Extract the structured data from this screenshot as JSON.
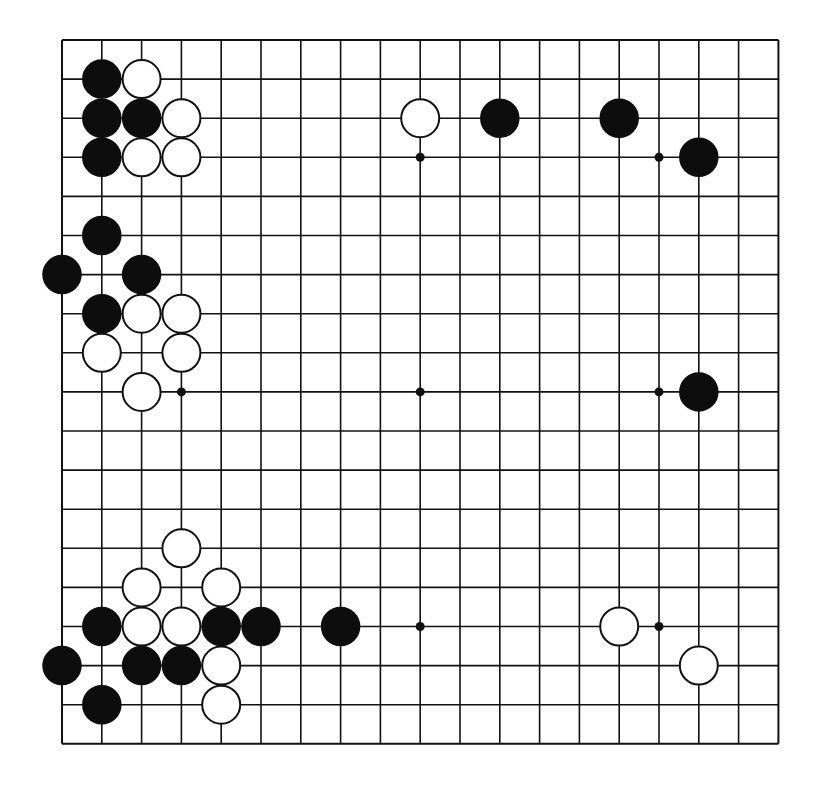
{
  "board": {
    "size": 19,
    "origin_x": 62,
    "origin_y": 40,
    "spacing_x": 39.8,
    "spacing_y": 39.1,
    "stone_radius": 19,
    "star_radius": 4.5,
    "colors": {
      "line": "#111111",
      "black_stone": "#0d0d0d",
      "white_stone": "#ffffff",
      "background": "#ffffff"
    },
    "star_points": [
      {
        "col": 3,
        "row": 3
      },
      {
        "col": 9,
        "row": 3
      },
      {
        "col": 15,
        "row": 3
      },
      {
        "col": 3,
        "row": 9
      },
      {
        "col": 9,
        "row": 9
      },
      {
        "col": 15,
        "row": 9
      },
      {
        "col": 3,
        "row": 15
      },
      {
        "col": 9,
        "row": 15
      },
      {
        "col": 15,
        "row": 15
      }
    ],
    "stones": [
      {
        "color": "black",
        "col": 1,
        "row": 1
      },
      {
        "color": "white",
        "col": 2,
        "row": 1
      },
      {
        "color": "black",
        "col": 1,
        "row": 2
      },
      {
        "color": "black",
        "col": 2,
        "row": 2
      },
      {
        "color": "white",
        "col": 3,
        "row": 2
      },
      {
        "color": "white",
        "col": 9,
        "row": 2
      },
      {
        "color": "black",
        "col": 11,
        "row": 2
      },
      {
        "color": "black",
        "col": 14,
        "row": 2
      },
      {
        "color": "black",
        "col": 1,
        "row": 3
      },
      {
        "color": "white",
        "col": 2,
        "row": 3
      },
      {
        "color": "white",
        "col": 3,
        "row": 3
      },
      {
        "color": "black",
        "col": 16,
        "row": 3
      },
      {
        "color": "black",
        "col": 1,
        "row": 5
      },
      {
        "color": "black",
        "col": 0,
        "row": 6
      },
      {
        "color": "black",
        "col": 2,
        "row": 6
      },
      {
        "color": "black",
        "col": 1,
        "row": 7
      },
      {
        "color": "white",
        "col": 2,
        "row": 7
      },
      {
        "color": "white",
        "col": 3,
        "row": 7
      },
      {
        "color": "white",
        "col": 1,
        "row": 8
      },
      {
        "color": "white",
        "col": 3,
        "row": 8
      },
      {
        "color": "white",
        "col": 2,
        "row": 9
      },
      {
        "color": "black",
        "col": 16,
        "row": 9
      },
      {
        "color": "white",
        "col": 3,
        "row": 13
      },
      {
        "color": "white",
        "col": 2,
        "row": 14
      },
      {
        "color": "white",
        "col": 4,
        "row": 14
      },
      {
        "color": "black",
        "col": 1,
        "row": 15
      },
      {
        "color": "white",
        "col": 2,
        "row": 15
      },
      {
        "color": "white",
        "col": 3,
        "row": 15
      },
      {
        "color": "black",
        "col": 4,
        "row": 15
      },
      {
        "color": "black",
        "col": 5,
        "row": 15
      },
      {
        "color": "black",
        "col": 7,
        "row": 15
      },
      {
        "color": "white",
        "col": 14,
        "row": 15
      },
      {
        "color": "black",
        "col": 0,
        "row": 16
      },
      {
        "color": "black",
        "col": 2,
        "row": 16
      },
      {
        "color": "black",
        "col": 3,
        "row": 16
      },
      {
        "color": "white",
        "col": 4,
        "row": 16
      },
      {
        "color": "white",
        "col": 16,
        "row": 16
      },
      {
        "color": "black",
        "col": 1,
        "row": 17
      },
      {
        "color": "white",
        "col": 4,
        "row": 17
      }
    ]
  }
}
